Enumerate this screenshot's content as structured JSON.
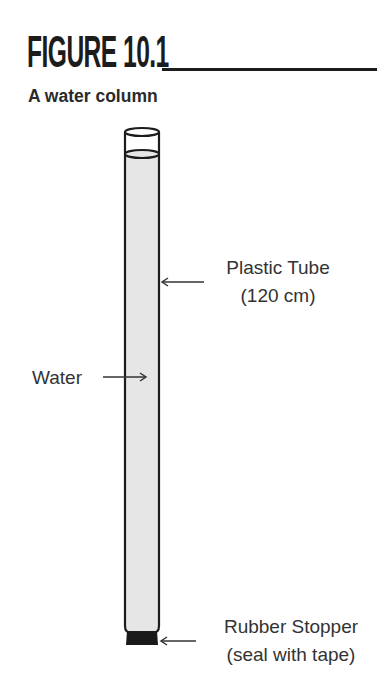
{
  "figure": {
    "title": "FIGURE 10.1",
    "subtitle": "A water column"
  },
  "labels": {
    "tube": {
      "line1": "Plastic Tube",
      "line2": "(120 cm)"
    },
    "water": "Water",
    "stopper": {
      "line1": "Rubber Stopper",
      "line2": "(seal with tape)"
    }
  },
  "colors": {
    "ink": "#1c1c1c",
    "water_fill": "#e6e6e6",
    "stopper_fill": "#1a1a1a"
  }
}
